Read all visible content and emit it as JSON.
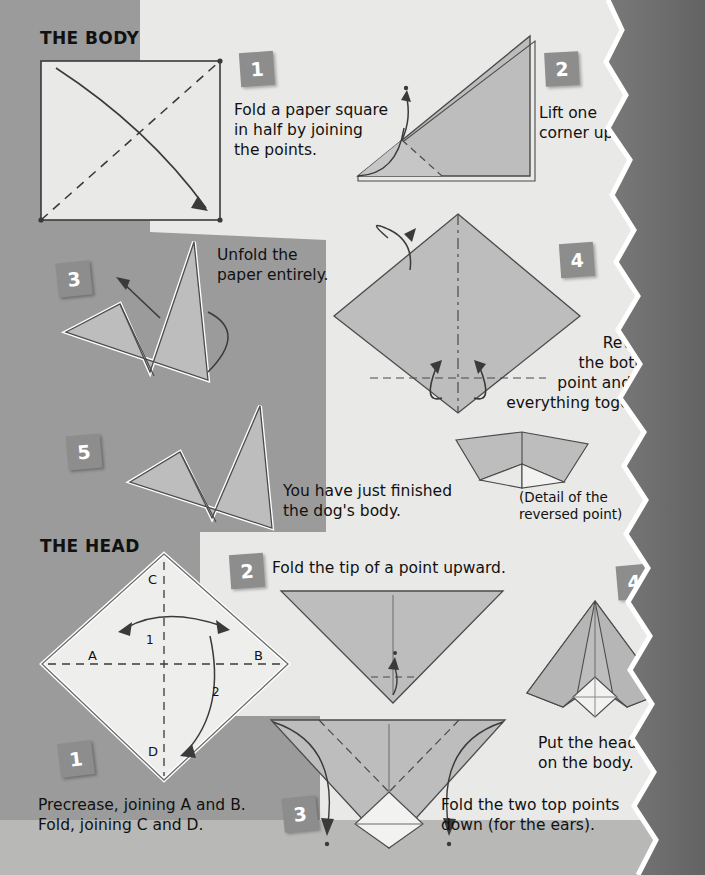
{
  "page": {
    "number": "21",
    "background_color": "#e9e9e7",
    "band_color": "#9b9b9b",
    "paper_fill_color": "#bdbdbd",
    "badge_color": "#8d8d8d",
    "dark_edge_color": "#6e6e6e"
  },
  "sections": [
    {
      "id": "body",
      "title": "THE BODY"
    },
    {
      "id": "head",
      "title": "THE HEAD"
    }
  ],
  "body_steps": [
    {
      "number": "1",
      "caption": "Fold a paper square\nin half by joining\nthe points."
    },
    {
      "number": "2",
      "caption": "Lift one\ncorner up."
    },
    {
      "number": "3",
      "caption": "Unfold the\npaper entirely."
    },
    {
      "number": "4",
      "caption": "Reverse\nthe bottom\npoint and fold\neverything together."
    },
    {
      "number": "5",
      "caption": "You have just finished\nthe dog's body."
    }
  ],
  "body_detail_caption": "(Detail of the\nreversed point)",
  "head_steps": [
    {
      "number": "1",
      "caption": "Precrease, joining A and B.\nFold, joining C and D."
    },
    {
      "number": "2",
      "caption": "Fold the tip of a point upward."
    },
    {
      "number": "3",
      "caption": "Fold the two top points\ndown (for the ears)."
    },
    {
      "number": "4",
      "caption": "Put the head\non the body."
    }
  ],
  "diagram_labels": {
    "point_a": "A",
    "point_b": "B",
    "point_c": "C",
    "point_d": "D",
    "fold_order_1": "1",
    "fold_order_2": "2"
  }
}
